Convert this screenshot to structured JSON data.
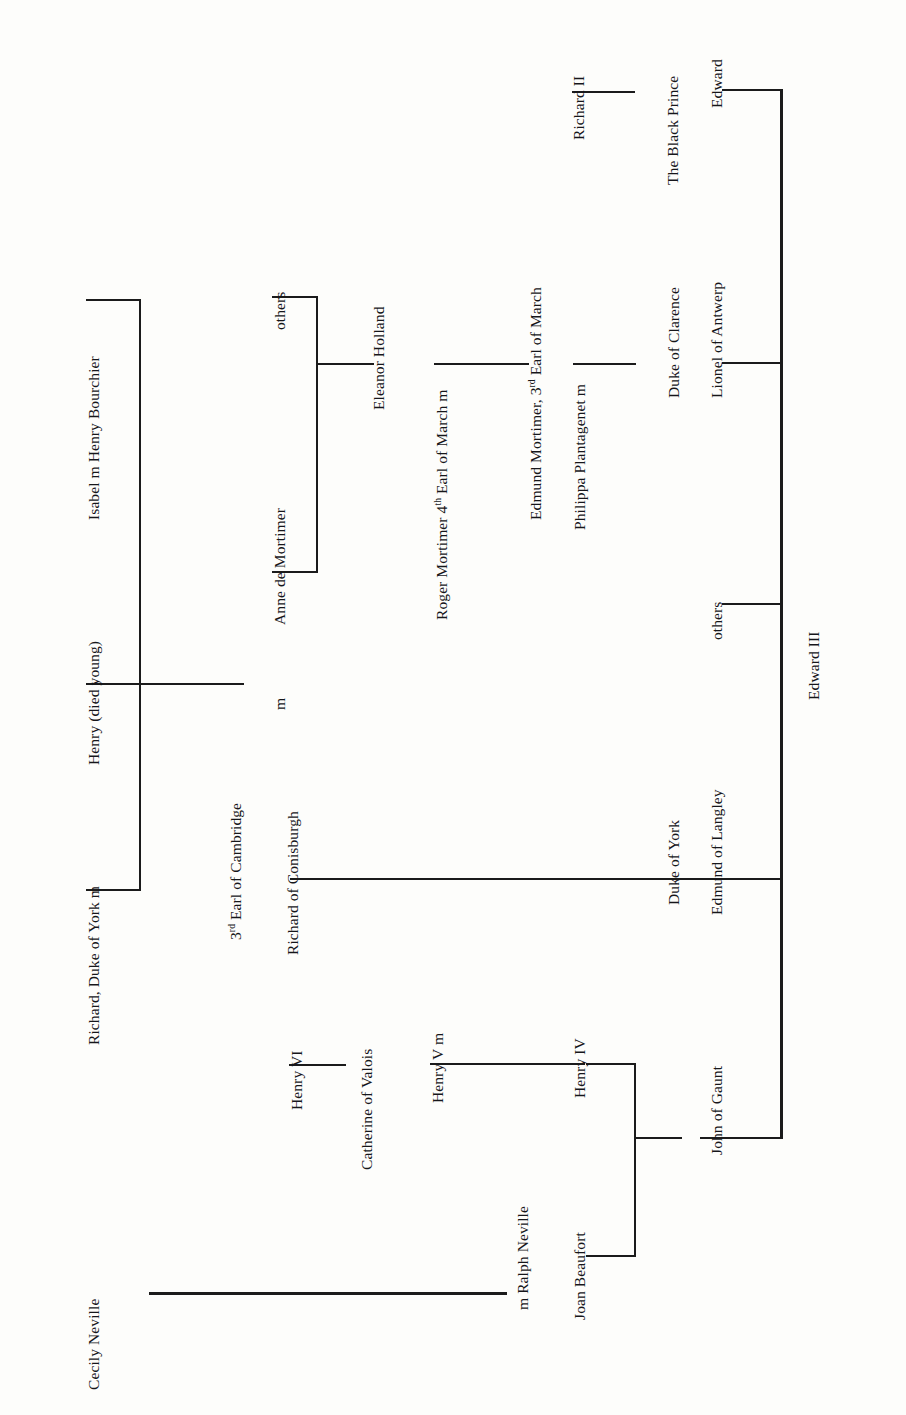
{
  "diagram": {
    "orientation": "rotated-90-ccw",
    "ink_color": "#1b1b1b",
    "background_color": "#fdfdfb"
  },
  "nodes": {
    "edward_iii": "Edward III",
    "edward": "Edward",
    "the_black_prince": "The Black Prince",
    "richard_ii": "Richard II",
    "lionel_of_antwerp": "Lionel of Antwerp",
    "duke_of_clarence": "Duke of Clarence",
    "philippa_plantagenet": "Philippa Plantagenet      m",
    "edmund_mortimer_3rd": "Edmund Mortimer, 3rd Earl of March",
    "edmund_mortimer_3rd_pre": "Edmund Mortimer, 3",
    "edmund_mortimer_3rd_sup": "rd",
    "edmund_mortimer_3rd_post": " Earl of March",
    "roger_mortimer_4th_pre": "Roger Mortimer 4",
    "roger_mortimer_4th_sup": "th",
    "roger_mortimer_4th_post": " Earl of March m",
    "eleanor_holland": "Eleanor Holland",
    "others_mortimer": "others",
    "anne_de_mortimer": "Anne de Mortimer",
    "m_anne_richard": "m",
    "richard_of_conisburgh": "Richard of Conisburgh",
    "third_earl_cambridge_pre": "3",
    "third_earl_cambridge_sup": "rd",
    "third_earl_cambridge_post": " Earl of Cambridge",
    "isabel_m_henry_bourchier": "Isabel m Henry Bourchier",
    "henry_died_young": "Henry (died young)",
    "richard_duke_of_york": "Richard, Duke of York   m",
    "others_edward_iii": "others",
    "edmund_of_langley": "Edmund of Langley",
    "duke_of_york": "Duke of York",
    "john_of_gaunt": "John of Gaunt",
    "henry_iv": "Henry IV",
    "henry_v": "Henry V m",
    "catherine_of_valois": "Catherine of Valois",
    "henry_vi": "Henry VI",
    "joan_beaufort": "Joan Beaufort",
    "m_ralph_neville": "m Ralph Neville",
    "cecily_neville": "Cecily Neville"
  },
  "generations": {
    "root": "Edward III",
    "children_of_edward_iii": [
      "Edward, The Black Prince",
      "Lionel of Antwerp, Duke of Clarence",
      "others",
      "Edmund of Langley, Duke of York",
      "John of Gaunt"
    ],
    "children_of_black_prince": [
      "Richard II"
    ],
    "children_of_lionel": [
      "Philippa Plantagenet"
    ],
    "philippa_married": "Edmund Mortimer, 3rd Earl of March",
    "children_of_philippa": [
      "Roger Mortimer 4th Earl of March"
    ],
    "roger_married": "Eleanor Holland",
    "children_of_roger": [
      "others",
      "Anne de Mortimer"
    ],
    "anne_married": "Richard of Conisburgh, 3rd Earl of Cambridge",
    "children_of_anne": [
      "Isabel m Henry Bourchier",
      "Henry (died young)",
      "Richard, Duke of York"
    ],
    "children_of_edmund_langley": [
      "Richard of Conisburgh, 3rd Earl of Cambridge"
    ],
    "children_of_john_of_gaunt": [
      "Henry IV",
      "Joan Beaufort"
    ],
    "children_of_henry_iv": [
      "Henry V"
    ],
    "henry_v_married": "Catherine of Valois",
    "children_of_henry_v": [
      "Henry VI"
    ],
    "joan_married": "Ralph Neville",
    "children_of_joan": [
      "Cecily Neville"
    ],
    "richard_york_married": "Cecily Neville"
  }
}
